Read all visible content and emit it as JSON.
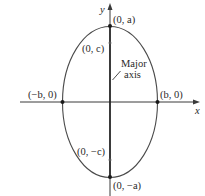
{
  "diagram": {
    "type": "ellipse-vertical-major-axis",
    "axes": {
      "x_label": "x",
      "y_label": "y"
    },
    "points": {
      "top_vertex": "(0, a)",
      "bottom_vertex": "(0, −a)",
      "focus_upper": "(0, c)",
      "focus_lower": "(0, −c)",
      "left_vertex": "(−b, 0)",
      "right_vertex": "(b, 0)"
    },
    "annotation": {
      "line1": "Major",
      "line2": "axis"
    },
    "colors": {
      "stroke": "#3a3a3a",
      "text": "#2a2a2a",
      "background": "#ffffff"
    }
  }
}
